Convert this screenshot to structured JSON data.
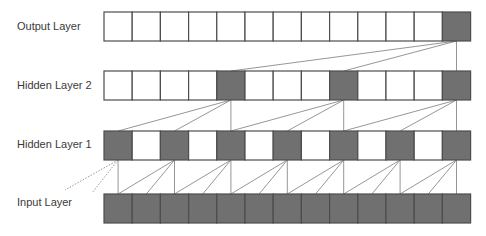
{
  "diagram": {
    "colors": {
      "filled_cell": "#707070",
      "empty_cell": "#ffffff",
      "cell_border": "#4d4d4d",
      "connection": "#8a8a8a",
      "label_text": "#3a3a3a"
    },
    "grid": {
      "x0": 104,
      "cell_width": 28.2,
      "cell_height": 29,
      "num_cells": 13
    },
    "layers": [
      {
        "id": "output",
        "label": "Output Layer",
        "y": 12,
        "label_y": 30,
        "filled": [
          12
        ]
      },
      {
        "id": "hidden2",
        "label": "Hidden Layer 2",
        "y": 71,
        "label_y": 89,
        "filled": [
          4,
          8,
          12
        ]
      },
      {
        "id": "hidden1",
        "label": "Hidden Layer 1",
        "y": 131,
        "label_y": 148,
        "filled": [
          0,
          2,
          4,
          6,
          8,
          10,
          12
        ]
      },
      {
        "id": "input",
        "label": "Input Layer",
        "y": 194,
        "label_y": 206,
        "filled": [
          0,
          1,
          2,
          3,
          4,
          5,
          6,
          7,
          8,
          9,
          10,
          11,
          12
        ]
      }
    ],
    "connections": [
      {
        "from_layer": "output",
        "to_layer": "hidden2",
        "dilation": 4,
        "sources": [
          12
        ]
      },
      {
        "from_layer": "hidden2",
        "to_layer": "hidden1",
        "dilation": 2,
        "sources": [
          4,
          8,
          12
        ]
      },
      {
        "from_layer": "hidden1",
        "to_layer": "input",
        "dilation": 1,
        "sources": [
          0,
          2,
          4,
          6,
          8,
          10,
          12
        ]
      }
    ],
    "dotted_connections": [
      {
        "from": [
          118,
          160
        ],
        "to": [
          65,
          190
        ]
      },
      {
        "from": [
          118,
          160
        ],
        "to": [
          92,
          193
        ]
      }
    ]
  }
}
